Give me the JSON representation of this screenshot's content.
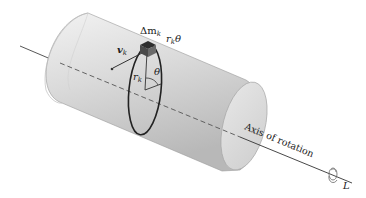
{
  "diagram": {
    "type": "rigid-body-rotation",
    "labels": {
      "mass_element": "Δm",
      "mass_subscript": "k",
      "arc_length_r": "r",
      "arc_length_sub": "k",
      "arc_length_theta": "θ",
      "velocity": "v",
      "velocity_subscript": "k",
      "radius": "r",
      "radius_subscript": "k",
      "angle": "θ",
      "axis": "Axis of rotation",
      "angular_momentum": "L"
    },
    "colors": {
      "cylinder_light": "#efefef",
      "cylinder_mid": "#d2d2d2",
      "cylinder_dark": "#b4b4b4",
      "end_cap": "#dcdcdc",
      "lines": "#333333",
      "circle": "#2a2a2a",
      "mass_block": "#3a3a3a"
    }
  }
}
